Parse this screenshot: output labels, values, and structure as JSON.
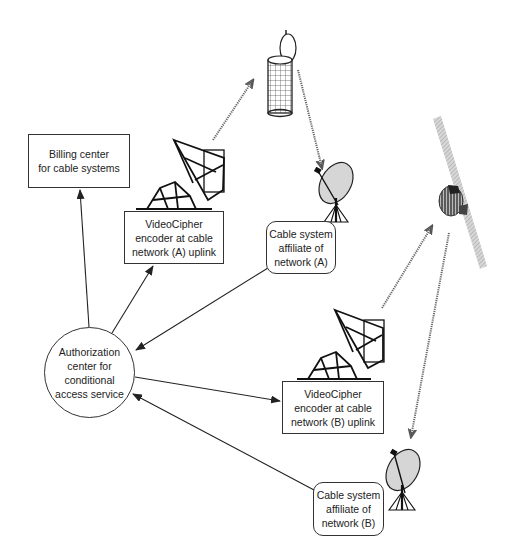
{
  "diagram": {
    "nodes": {
      "billing": {
        "lines": [
          "Billing center",
          "for cable systems"
        ]
      },
      "encoder_a": {
        "lines": [
          "VideoCipher",
          "encoder at cable",
          "network (A) uplink"
        ]
      },
      "affiliate_a": {
        "lines": [
          "Cable system",
          "affiliate of",
          "network (A)"
        ]
      },
      "authorization": {
        "lines": [
          "Authorization",
          "center for",
          "conditional",
          "access service"
        ]
      },
      "encoder_b": {
        "lines": [
          "VideoCipher",
          "encoder at cable",
          "network (B) uplink"
        ]
      },
      "affiliate_b": {
        "lines": [
          "Cable system",
          "affiliate of",
          "network (B)"
        ]
      }
    },
    "icons": {
      "satellite_a": "cylindrical-satellite-icon",
      "satellite_b": "solar-panel-satellite-icon",
      "uplink_dish_a": "uplink-dish-icon",
      "uplink_dish_b": "uplink-dish-icon",
      "receive_dish_a": "receive-dish-icon",
      "receive_dish_b": "receive-dish-icon"
    },
    "edges": [
      {
        "from": "authorization",
        "to": "billing",
        "style": "solid"
      },
      {
        "from": "authorization",
        "to": "encoder_a",
        "style": "solid"
      },
      {
        "from": "affiliate_a",
        "to": "authorization",
        "style": "solid"
      },
      {
        "from": "authorization",
        "to": "encoder_b",
        "style": "solid"
      },
      {
        "from": "affiliate_b",
        "to": "authorization",
        "style": "solid"
      },
      {
        "from": "uplink_dish_a",
        "to": "satellite_a",
        "style": "dotted"
      },
      {
        "from": "satellite_a",
        "to": "receive_dish_a",
        "style": "dotted"
      },
      {
        "from": "uplink_dish_b",
        "to": "satellite_b",
        "style": "dotted"
      },
      {
        "from": "satellite_b",
        "to": "receive_dish_b",
        "style": "dotted"
      }
    ],
    "colors": {
      "line": "#333333",
      "signal": "#666666",
      "dish_fill": "#d6d6d6",
      "panel_fill": "#bdbdbd",
      "satellite_body": "#555555"
    }
  }
}
